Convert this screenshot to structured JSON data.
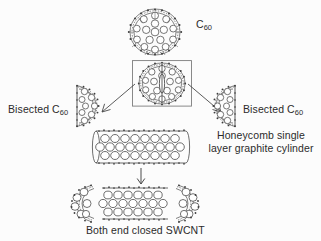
{
  "figure": {
    "background_color": "#fcfcfc",
    "ink_color": "#3a3a3a",
    "text_color": "#2b2b2b"
  },
  "labels": {
    "c60": "C",
    "c60_sub": "60",
    "bisected_left": "Bisected C",
    "bisected_left_sub": "60",
    "bisected_right": "Bisected C",
    "bisected_right_sub": "60",
    "honeycomb": "Honeycomb single layer graphite cylinder",
    "swcnt": "Both end closed SWCNT"
  },
  "structures": {
    "fullerene_top": "c60-fullerene-sphere",
    "fullerene_boxed": "c60-fullerene-bisected-boxed",
    "hemisphere_left": "bisected-c60-left-hemisphere",
    "hemisphere_right": "bisected-c60-right-hemisphere",
    "cylinder": "honeycomb-graphite-cylinder",
    "nanotube": "both-end-closed-swcnt"
  },
  "arrows": {
    "left": "arrow-down-left",
    "right": "arrow-down-right",
    "down": "arrow-down"
  }
}
